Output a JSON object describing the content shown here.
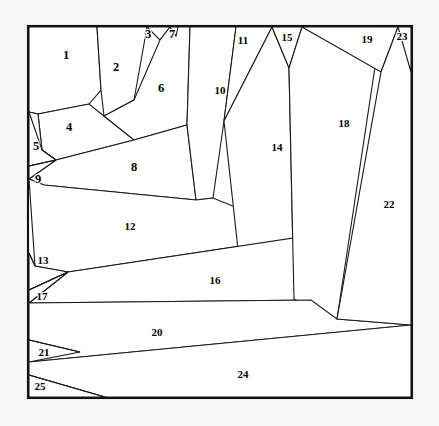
{
  "figure": {
    "type": "planar-subdivision",
    "background_color": "#f7f7f7",
    "canvas_color": "#ffffff",
    "line_color": "#1a1a1a",
    "frame_color": "#111111",
    "label_color": "#000000",
    "region_count": 25,
    "frame": {
      "x": 28,
      "y": 26,
      "width": 384,
      "height": 372
    }
  },
  "regions": [
    {
      "id": 1,
      "label": "1",
      "label_x": 66,
      "label_y": 56,
      "points": "29,27 97,27 101,90 89,104 38,114 29,112"
    },
    {
      "id": 2,
      "label": "2",
      "label_x": 116,
      "label_y": 68,
      "points": "97,27 147,27 134,100 104,116 101,90"
    },
    {
      "id": 3,
      "label": "3",
      "label_x": 148,
      "label_y": 35,
      "points": "147,27 170,27 160,40"
    },
    {
      "id": 4,
      "label": "4",
      "label_x": 69,
      "label_y": 128,
      "points": "38,114 89,104 104,116 134,140 56,160 42,150"
    },
    {
      "id": 5,
      "label": "5",
      "label_x": 36,
      "label_y": 147,
      "points": "29,112 38,114 42,150 56,160 29,166"
    },
    {
      "id": 6,
      "label": "6",
      "label_x": 161,
      "label_y": 89,
      "points": "160,40 170,27 190,27 187,125 134,140 104,116 134,100"
    },
    {
      "id": 7,
      "label": "7",
      "label_x": 172,
      "label_y": 35,
      "points": "170,27 178,27 176,36"
    },
    {
      "id": 8,
      "label": "8",
      "label_x": 134,
      "label_y": 168,
      "points": "56,160 134,140 187,125 196,200 44,185 29,179"
    },
    {
      "id": 9,
      "label": "9",
      "label_x": 38,
      "label_y": 180,
      "points": "29,166 56,160 29,179"
    },
    {
      "id": 10,
      "label": "10",
      "label_x": 220,
      "label_y": 91,
      "points": "190,27 236,27 224,121 213,198 196,200 187,125"
    },
    {
      "id": 11,
      "label": "11",
      "label_x": 243,
      "label_y": 41,
      "points": "236,27 272,27 224,121"
    },
    {
      "id": 12,
      "label": "12",
      "label_x": 130,
      "label_y": 227,
      "points": "29,179 44,185 196,200 213,198 307,236 68,272 35,266"
    },
    {
      "id": 13,
      "label": "13",
      "label_x": 43,
      "label_y": 261,
      "points": "29,253 35,266 68,272 29,290"
    },
    {
      "id": 14,
      "label": "14",
      "label_x": 277,
      "label_y": 148,
      "points": "272,27 289,68 294,299 242,286 224,121"
    },
    {
      "id": 15,
      "label": "15",
      "label_x": 287,
      "label_y": 38,
      "points": "272,27 302,27 289,68"
    },
    {
      "id": 16,
      "label": "16",
      "label_x": 215,
      "label_y": 281,
      "points": "68,272 307,236 311,300 29,303"
    },
    {
      "id": 17,
      "label": "17",
      "label_x": 42,
      "label_y": 297,
      "points": "29,290 68,272 29,303"
    },
    {
      "id": 18,
      "label": "18",
      "label_x": 344,
      "label_y": 124,
      "points": "302,27 381,27 337,319 294,299 289,68"
    },
    {
      "id": 19,
      "label": "19",
      "label_x": 367,
      "label_y": 40,
      "points": "302,27 398,27 381,72"
    },
    {
      "id": 20,
      "label": "20",
      "label_x": 157,
      "label_y": 333,
      "points": "29,303 311,300 337,319 411,325 29,362"
    },
    {
      "id": 21,
      "label": "21",
      "label_x": 44,
      "label_y": 353,
      "points": "29,340 29,362 80,352"
    },
    {
      "id": 22,
      "label": "22",
      "label_x": 389,
      "label_y": 205,
      "points": "398,27 411,27 411,325 337,319 381,72"
    },
    {
      "id": 23,
      "label": "23",
      "label_x": 402,
      "label_y": 37,
      "points": "398,27 411,27 411,72"
    },
    {
      "id": 24,
      "label": "24",
      "label_x": 243,
      "label_y": 375,
      "points": "29,362 411,325 411,397 29,397"
    },
    {
      "id": 25,
      "label": "25",
      "label_x": 40,
      "label_y": 387,
      "points": "29,375 29,397 105,397"
    }
  ],
  "extra_edges": [
    {
      "name": "edge-4-5-split",
      "d": "M 29,112 L 42,150 L 56,160"
    },
    {
      "name": "edge-13-split",
      "d": "M 29,253 L 35,266"
    },
    {
      "name": "edge-21-split",
      "d": "M 29,340 L 80,352"
    },
    {
      "name": "edge-25-split",
      "d": "M 29,375 L 105,397"
    },
    {
      "name": "edge-17-split",
      "d": "M 29,290 L 68,272"
    },
    {
      "name": "edge-9-split",
      "d": "M 29,166 L 56,160"
    }
  ]
}
